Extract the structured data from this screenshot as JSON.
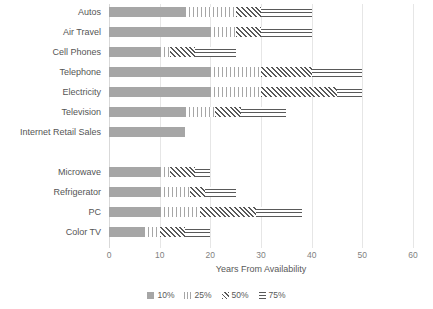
{
  "chart_data": {
    "type": "bar",
    "subtype": "stacked-horizontal-range",
    "title": "",
    "xlabel": "Years From Availability",
    "ylabel": "",
    "xlim": [
      0,
      60
    ],
    "xticks": [
      0,
      10,
      20,
      30,
      40,
      50,
      60
    ],
    "grid": true,
    "legend_position": "bottom",
    "legend": [
      "10%",
      "25%",
      "50%",
      "75%"
    ],
    "series": [
      {
        "name": "10%",
        "values": [
          15,
          20,
          10,
          20,
          20,
          15,
          15,
          null,
          10,
          10,
          10,
          7
        ]
      },
      {
        "name": "25%",
        "values": [
          25,
          25,
          12,
          30,
          30,
          21,
          null,
          null,
          12,
          16,
          18,
          10
        ]
      },
      {
        "name": "50%",
        "values": [
          30,
          30,
          17,
          40,
          45,
          26,
          null,
          null,
          17,
          19,
          29,
          15
        ]
      },
      {
        "name": "75%",
        "values": [
          40,
          40,
          25,
          50,
          50,
          35,
          null,
          null,
          20,
          25,
          38,
          20
        ]
      }
    ],
    "categories": [
      "Autos",
      "Air Travel",
      "Cell Phones",
      "Telephone",
      "Electricity",
      "Television",
      "Internet Retail Sales",
      "",
      "Microwave",
      "Refrigerator",
      "PC",
      "Color TV"
    ],
    "rows": [
      {
        "label": "Autos",
        "p10": 15,
        "p25": 25,
        "p50": 30,
        "p75": 40
      },
      {
        "label": "Air Travel",
        "p10": 20,
        "p25": 25,
        "p50": 30,
        "p75": 40
      },
      {
        "label": "Cell Phones",
        "p10": 10,
        "p25": 12,
        "p50": 17,
        "p75": 25
      },
      {
        "label": "Telephone",
        "p10": 20,
        "p25": 30,
        "p50": 40,
        "p75": 50
      },
      {
        "label": "Electricity",
        "p10": 20,
        "p25": 30,
        "p50": 45,
        "p75": 50
      },
      {
        "label": "Television",
        "p10": 15,
        "p25": 21,
        "p50": 26,
        "p75": 35
      },
      {
        "label": "Internet Retail Sales",
        "p10": 15,
        "p25": null,
        "p50": null,
        "p75": null
      },
      {
        "label": "",
        "p10": null,
        "p25": null,
        "p50": null,
        "p75": null
      },
      {
        "label": "Microwave",
        "p10": 10,
        "p25": 12,
        "p50": 17,
        "p75": 20
      },
      {
        "label": "Refrigerator",
        "p10": 10,
        "p25": 16,
        "p50": 19,
        "p75": 25
      },
      {
        "label": "PC",
        "p10": 10,
        "p25": 18,
        "p50": 29,
        "p75": 38
      },
      {
        "label": "Color TV",
        "p10": 7,
        "p25": 10,
        "p50": 15,
        "p75": 20
      }
    ],
    "colors": {
      "p10": "#a6a6a6",
      "p25": "#a6a6a6",
      "p50": "#595959",
      "p75": "#595959",
      "grid": "#e6e6e6",
      "text": "#595959"
    }
  }
}
